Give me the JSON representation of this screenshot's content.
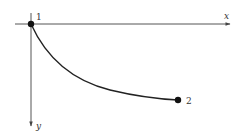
{
  "diagram": {
    "type": "curve-between-points",
    "axes": {
      "x": {
        "label": "x",
        "direction": "right"
      },
      "y": {
        "label": "y",
        "direction": "down"
      }
    },
    "points": [
      {
        "id": "p1",
        "label": "1"
      },
      {
        "id": "p2",
        "label": "2"
      }
    ],
    "colors": {
      "axis": "#555555",
      "curve": "#222222",
      "point": "#111111",
      "text": "#333333"
    }
  }
}
